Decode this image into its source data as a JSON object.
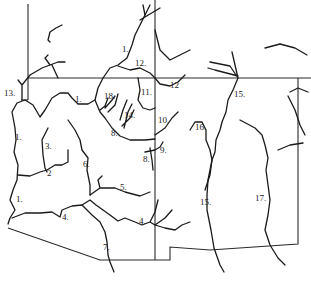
{
  "map": {
    "description": "Line drawing of river drainage systems with numbered river labels",
    "labels": [
      {
        "id": "1a",
        "text": "1.",
        "x": 122,
        "y": 52
      },
      {
        "id": "12a",
        "text": "12.",
        "x": 135,
        "y": 66
      },
      {
        "id": "12b",
        "text": "12",
        "x": 170,
        "y": 88
      },
      {
        "id": "13",
        "text": "13.",
        "x": 4,
        "y": 96
      },
      {
        "id": "1b",
        "text": "1.",
        "x": 75,
        "y": 102
      },
      {
        "id": "18a",
        "text": "18.",
        "x": 104,
        "y": 99
      },
      {
        "id": "11",
        "text": "11.",
        "x": 141,
        "y": 95
      },
      {
        "id": "14",
        "text": "14.",
        "x": 124,
        "y": 118
      },
      {
        "id": "15a",
        "text": "15.",
        "x": 234,
        "y": 97
      },
      {
        "id": "16",
        "text": "16.",
        "x": 195,
        "y": 130
      },
      {
        "id": "10",
        "text": "10.",
        "x": 158,
        "y": 123
      },
      {
        "id": "8a",
        "text": "8.",
        "x": 111,
        "y": 136
      },
      {
        "id": "9",
        "text": "9.",
        "x": 160,
        "y": 153
      },
      {
        "id": "8b",
        "text": "8.",
        "x": 143,
        "y": 162
      },
      {
        "id": "1c",
        "text": "1.",
        "x": 15,
        "y": 140
      },
      {
        "id": "3",
        "text": "3.",
        "x": 45,
        "y": 149
      },
      {
        "id": "6",
        "text": "6.",
        "x": 83,
        "y": 167
      },
      {
        "id": "2",
        "text": "2",
        "x": 47,
        "y": 176
      },
      {
        "id": "5",
        "text": "5.",
        "x": 120,
        "y": 190
      },
      {
        "id": "1d",
        "text": "1.",
        "x": 16,
        "y": 202
      },
      {
        "id": "15b",
        "text": "15.",
        "x": 200,
        "y": 205
      },
      {
        "id": "17",
        "text": "17.",
        "x": 255,
        "y": 201
      },
      {
        "id": "4a",
        "text": "4.",
        "x": 62,
        "y": 220
      },
      {
        "id": "4b",
        "text": "4.",
        "x": 139,
        "y": 224
      },
      {
        "id": "7",
        "text": "7.",
        "x": 103,
        "y": 250
      }
    ]
  }
}
